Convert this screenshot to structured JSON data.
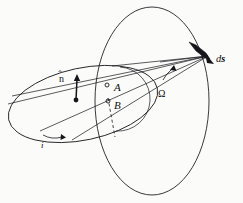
{
  "figure": {
    "kind": "diagram",
    "width": 243,
    "height": 203,
    "background_color": "#fbfbfa",
    "ink_color": "#16161a"
  },
  "labels": {
    "normal_vector": "n",
    "normal_hat": "̂",
    "node_a": "A",
    "node_b": "B",
    "inclination": "i",
    "ascending_node": "Ω",
    "surface_element_d": "d",
    "surface_element_s": "s"
  },
  "geometry": {
    "reference_plane_ellipse": {
      "name": "reference-plane-ellipse",
      "cx": 152,
      "cy": 101,
      "rx": 57,
      "ry": 94,
      "rotation_deg": 0,
      "stroke": "#16161a",
      "stroke_width": 0.85
    },
    "orbital_plane_ellipse": {
      "name": "orbital-plane-ellipse",
      "cx": 83,
      "cy": 104,
      "rx": 76,
      "ry": 36,
      "rotation_deg": -12,
      "stroke": "#16161a",
      "stroke_width": 0.85
    },
    "small_circle_arc": {
      "name": "small-circle-arc",
      "cx": 120,
      "cy": 99,
      "r": 32,
      "stroke": "#16161a",
      "stroke_width": 0.7
    },
    "convergence_point": {
      "x": 208,
      "y": 56
    },
    "sight_lines": [
      {
        "name": "sight-line-top",
        "x1": 12,
        "y1": 96,
        "x2": 208,
        "y2": 56
      },
      {
        "name": "sight-line-upper",
        "x1": 8,
        "y1": 104,
        "x2": 208,
        "y2": 56
      },
      {
        "name": "sight-line-mid",
        "x1": 40,
        "y1": 131,
        "x2": 208,
        "y2": 56
      },
      {
        "name": "sight-line-low",
        "x1": 72,
        "y1": 140,
        "x2": 208,
        "y2": 56
      },
      {
        "name": "sight-line-node",
        "x1": 112,
        "y1": 66,
        "x2": 208,
        "y2": 56
      },
      {
        "name": "sight-line-omega",
        "x1": 160,
        "y1": 62,
        "x2": 208,
        "y2": 56
      }
    ],
    "dashed_line": {
      "name": "hidden-node-line",
      "x1": 108,
      "y1": 98,
      "x2": 115,
      "y2": 137,
      "dash": "3 2.5"
    },
    "normal_arrow": {
      "name": "unit-normal-arrow",
      "x_base": 76,
      "y_base": 100,
      "x_tip": 77,
      "y_tip": 74
    },
    "ds_wedge": {
      "name": "surface-element-wedge",
      "points": "189,42 196,45 206,53 210,59 205,58 196,51"
    },
    "ds_arrowhead": {
      "name": "surface-element-arrowhead",
      "points": "205,53 214,64 207,63"
    },
    "inclination_arc": {
      "name": "inclination-angle-arc",
      "path": "M 43 135 Q 52 140 62 137"
    },
    "omega_arc": {
      "name": "ascending-node-angle-arc",
      "path": "M 172 69 Q 166 74 163 80"
    }
  },
  "label_positions": {
    "nhat": {
      "x": 59,
      "y": 74
    },
    "node_a": {
      "x": 114,
      "y": 82
    },
    "node_b": {
      "x": 114,
      "y": 100
    },
    "inclination": {
      "x": 41,
      "y": 141
    },
    "ascending_node": {
      "x": 158,
      "y": 89
    },
    "ds": {
      "x": 216,
      "y": 54
    }
  },
  "markers": {
    "node_a_dot": {
      "name": "node-a-marker",
      "cx": 107,
      "cy": 85,
      "r": 2.0
    },
    "node_b_dot": {
      "name": "node-b-marker",
      "cx": 108,
      "cy": 101,
      "r": 2.0
    },
    "normal_base_dot": {
      "name": "normal-base-dot",
      "cx": 76,
      "cy": 100,
      "r": 2.4
    }
  }
}
